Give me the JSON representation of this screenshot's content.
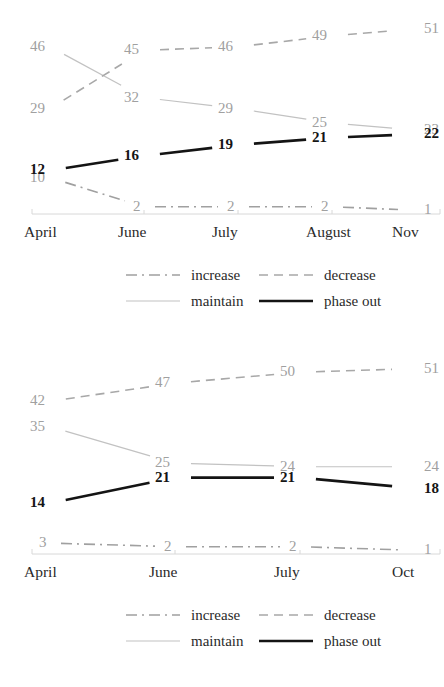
{
  "chart_data": [
    {
      "type": "line",
      "title": "",
      "xlabel": "",
      "ylabel": "",
      "categories": [
        "April",
        "June",
        "July",
        "August",
        "Nov"
      ],
      "grid": false,
      "legend_position": "bottom",
      "ylim": [
        0,
        55
      ],
      "series": [
        {
          "name": "increase",
          "style": "dash-dot",
          "color": "#a0a0a0",
          "width": 1.6,
          "bold_labels": false,
          "values": [
            10,
            2,
            2,
            2,
            1
          ]
        },
        {
          "name": "maintain",
          "style": "solid",
          "color": "#c2c2c2",
          "width": 1.2,
          "bold_labels": false,
          "values": [
            46,
            32,
            29,
            25,
            23
          ]
        },
        {
          "name": "decrease",
          "style": "dashed",
          "color": "#a8a8a8",
          "width": 1.6,
          "bold_labels": false,
          "values": [
            29,
            45,
            46,
            49,
            51
          ]
        },
        {
          "name": "phase out",
          "style": "solid",
          "color": "#141414",
          "width": 2.6,
          "bold_labels": true,
          "values": [
            12,
            16,
            19,
            21,
            22
          ]
        }
      ],
      "legend": [
        {
          "label": "increase",
          "style": "dash-dot",
          "color": "#a0a0a0",
          "width": 1.6
        },
        {
          "label": "maintain",
          "style": "solid",
          "color": "#c2c2c2",
          "width": 1.2
        },
        {
          "label": "decrease",
          "style": "dashed",
          "color": "#a8a8a8",
          "width": 1.6
        },
        {
          "label": "phase out",
          "style": "solid",
          "color": "#141414",
          "width": 2.6
        }
      ]
    },
    {
      "type": "line",
      "title": "",
      "xlabel": "",
      "ylabel": "",
      "categories": [
        "April",
        "June",
        "July",
        "Oct"
      ],
      "grid": false,
      "legend_position": "bottom",
      "ylim": [
        0,
        55
      ],
      "series": [
        {
          "name": "increase",
          "style": "dash-dot",
          "color": "#a0a0a0",
          "width": 1.6,
          "bold_labels": false,
          "values": [
            3,
            2,
            2,
            1
          ]
        },
        {
          "name": "maintain",
          "style": "solid",
          "color": "#c2c2c2",
          "width": 1.2,
          "bold_labels": false,
          "values": [
            35,
            25,
            24,
            24
          ]
        },
        {
          "name": "decrease",
          "style": "dashed",
          "color": "#a8a8a8",
          "width": 1.6,
          "bold_labels": false,
          "values": [
            42,
            47,
            50,
            51
          ]
        },
        {
          "name": "phase out",
          "style": "solid",
          "color": "#141414",
          "width": 2.6,
          "bold_labels": true,
          "values": [
            14,
            21,
            21,
            18
          ]
        }
      ],
      "legend": [
        {
          "label": "increase",
          "style": "dash-dot",
          "color": "#a0a0a0",
          "width": 1.6
        },
        {
          "label": "maintain",
          "style": "solid",
          "color": "#c2c2c2",
          "width": 1.2
        },
        {
          "label": "decrease",
          "style": "dashed",
          "color": "#a8a8a8",
          "width": 1.6
        },
        {
          "label": "phase out",
          "style": "solid",
          "color": "#141414",
          "width": 2.6
        }
      ]
    }
  ],
  "colors": {
    "axis": "#d8d8d8",
    "grey_label": "#a0a0a0",
    "dark_label": "#151515",
    "tick_text": "#2a2a2a",
    "background": "#ffffff"
  }
}
